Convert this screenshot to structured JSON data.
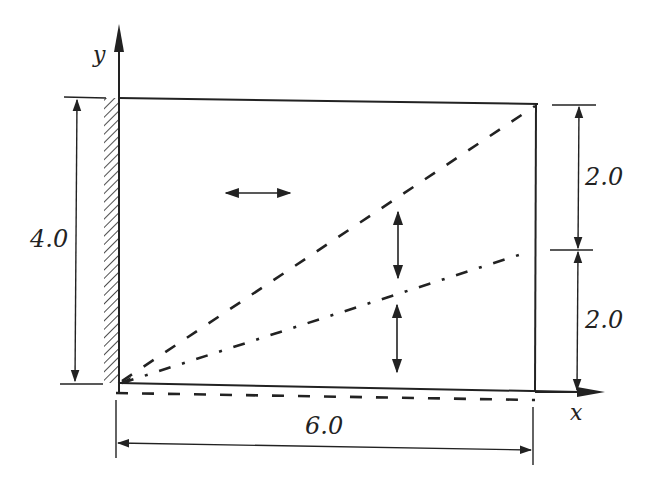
{
  "diagram": {
    "type": "cantilever plate dimension sketch",
    "axes": {
      "x_label": "x",
      "y_label": "y"
    },
    "dimensions": {
      "height_total": "4.0",
      "width": "6.0",
      "right_upper": "2.0",
      "right_lower": "2.0"
    },
    "elements": [
      {
        "name": "fixed-wall",
        "style": "hatched"
      },
      {
        "name": "plate-outline",
        "style": "solid"
      },
      {
        "name": "diagonal-line",
        "style": "dashed"
      },
      {
        "name": "mid-line",
        "style": "dash-dot"
      },
      {
        "name": "bottom-edge-deformed",
        "style": "dashed"
      },
      {
        "name": "horizontal-double-arrow",
        "style": "solid"
      },
      {
        "name": "vertical-double-arrow-upper",
        "style": "solid"
      },
      {
        "name": "vertical-double-arrow-lower",
        "style": "solid"
      }
    ],
    "colors": {
      "ink": "#222222",
      "background": "#ffffff"
    }
  }
}
